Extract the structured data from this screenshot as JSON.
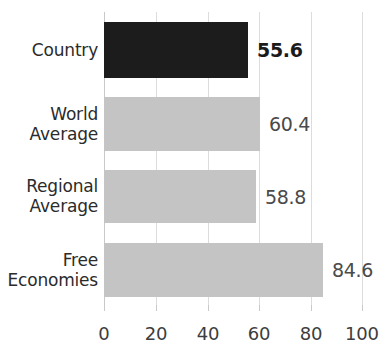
{
  "chart_data": {
    "type": "bar",
    "orientation": "horizontal",
    "title": "",
    "subtitle": "",
    "xlabel": "",
    "ylabel": "",
    "xlim": [
      0,
      100
    ],
    "xticks": [
      0,
      20,
      40,
      60,
      80,
      100
    ],
    "xtick_labels": [
      "0",
      "20",
      "40",
      "60",
      "80",
      "100"
    ],
    "grid": "vertical",
    "legend": "none",
    "categories": [
      "Country",
      "World\nAverage",
      "Regional\nAverage",
      "Free\nEconomies"
    ],
    "values": [
      55.6,
      58.8,
      60.4,
      84.6
    ],
    "bars": [
      {
        "category": "Country",
        "value": 55.6,
        "value_label": "55.6",
        "color": "#1c1c1c",
        "highlight": true
      },
      {
        "category": "World\nAverage",
        "value": 60.4,
        "value_label": "60.4",
        "color": "#c4c4c4",
        "highlight": false
      },
      {
        "category": "Regional\nAverage",
        "value": 58.8,
        "value_label": "58.8",
        "color": "#c4c4c4",
        "highlight": false
      },
      {
        "category": "Free\nEconomies",
        "value": 84.6,
        "value_label": "84.6",
        "color": "#c4c4c4",
        "highlight": false
      }
    ]
  },
  "colors": {
    "highlight_bar": "#1c1c1c",
    "default_bar": "#c4c4c4",
    "gridline": "#dcdcdc",
    "axis": "#c9c9c9",
    "label_text": "#2b2b2b",
    "value_text": "#4a4a4a",
    "value_text_emphasis": "#1b1b1b",
    "background": "#ffffff"
  }
}
